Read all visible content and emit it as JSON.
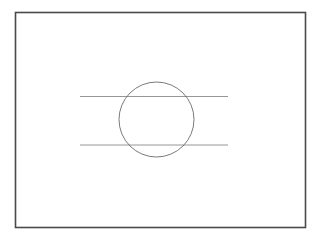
{
  "canvas": {
    "width": 322,
    "height": 241,
    "background_color": "#ffffff",
    "title": "Circle intersected by two horizontal secant lines inside a rectangular frame"
  },
  "colors": {
    "frame_stroke": "#4a4a4a",
    "circle_stroke": "#6b6b6b",
    "line_stroke": "#8a8a8a",
    "background": "#ffffff"
  },
  "figure": {
    "frame": {
      "name": "outer-frame",
      "x": 15.5,
      "y": 12.5,
      "width": 290,
      "height": 215,
      "stroke_width": 1.6,
      "stroke_color": "#4a4a4a",
      "fill": "#ffffff"
    },
    "circle": {
      "name": "circle",
      "cx": 156.5,
      "cy": 119.5,
      "r": 37.5,
      "stroke_width": 0.9,
      "stroke_color": "#6b6b6b",
      "fill": "none"
    },
    "lines": [
      {
        "name": "upper-secant-line",
        "x1": 80,
        "y1": 96.5,
        "x2": 228,
        "y2": 96.5,
        "stroke_width": 0.9,
        "stroke_color": "#8a8a8a"
      },
      {
        "name": "lower-secant-line",
        "x1": 80,
        "y1": 145,
        "x2": 228,
        "y2": 145,
        "stroke_width": 0.9,
        "stroke_color": "#8a8a8a"
      }
    ]
  },
  "chart_data": {
    "type": "diagram",
    "title": "",
    "shapes": [
      {
        "shape": "rectangle",
        "role": "frame",
        "x": 15.5,
        "y": 12.5,
        "width": 290,
        "height": 215
      },
      {
        "shape": "circle",
        "role": "primary-circle",
        "center_x": 156.5,
        "center_y": 119.5,
        "radius": 37.5
      },
      {
        "shape": "line",
        "role": "upper-secant",
        "x1": 80,
        "y1": 96.5,
        "x2": 228,
        "y2": 96.5
      },
      {
        "shape": "line",
        "role": "lower-secant",
        "x1": 80,
        "y1": 145,
        "x2": 228,
        "y2": 145
      }
    ],
    "annotations": [],
    "legend": [],
    "grid": false
  }
}
